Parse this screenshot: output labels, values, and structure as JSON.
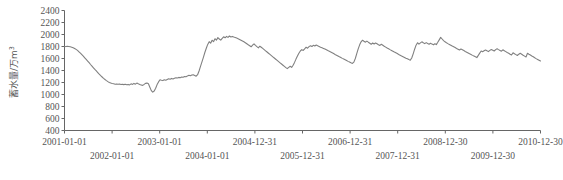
{
  "chart_data": {
    "type": "line",
    "title": "",
    "xlabel": "",
    "ylabel": "蓄水量/万m³",
    "ylabel_text": "蓄水量/万m3",
    "ylim": [
      400,
      2400
    ],
    "ytick_step": 200,
    "yticks": [
      400,
      600,
      800,
      1000,
      1200,
      1400,
      1600,
      1800,
      2000,
      2200,
      2400
    ],
    "xticks_top_row": [
      "2001-01-01",
      "2003-01-01",
      "2004-12-31",
      "2006-12-31",
      "2008-12-30",
      "2010-12-30"
    ],
    "xticks_bottom_row": [
      "2002-01-01",
      "2004-01-01",
      "2005-12-31",
      "2007-12-31",
      "2009-12-30"
    ],
    "xticks_all": [
      "2001-01-01",
      "2002-01-01",
      "2003-01-01",
      "2004-01-01",
      "2004-12-31",
      "2005-12-31",
      "2006-12-31",
      "2007-12-31",
      "2008-12-30",
      "2009-12-30",
      "2010-12-30"
    ],
    "xlim": [
      "2001-01-01",
      "2010-12-30"
    ],
    "grid": false,
    "legend": "none",
    "line_color": "#808080",
    "axis_color": "#666666",
    "series": [
      {
        "name": "蓄水量",
        "values": [
          1795,
          1800,
          1803,
          1800,
          1795,
          1788,
          1780,
          1768,
          1752,
          1735,
          1712,
          1690,
          1665,
          1640,
          1612,
          1585,
          1558,
          1530,
          1500,
          1472,
          1445,
          1418,
          1392,
          1366,
          1340,
          1315,
          1292,
          1270,
          1250,
          1232,
          1215,
          1200,
          1190,
          1182,
          1178,
          1172,
          1176,
          1170,
          1175,
          1168,
          1172,
          1165,
          1170,
          1162,
          1168,
          1160,
          1178,
          1168,
          1185,
          1172,
          1190,
          1178,
          1168,
          1160,
          1152,
          1168,
          1185,
          1190,
          1178,
          1120,
          1065,
          1040,
          1058,
          1105,
          1165,
          1210,
          1245,
          1238,
          1232,
          1245,
          1238,
          1250,
          1262,
          1255,
          1268,
          1260,
          1272,
          1280,
          1275,
          1285,
          1280,
          1292,
          1288,
          1300,
          1295,
          1310,
          1320,
          1312,
          1325,
          1330,
          1318,
          1305,
          1330,
          1392,
          1470,
          1545,
          1620,
          1700,
          1770,
          1835,
          1880,
          1855,
          1905,
          1880,
          1930,
          1905,
          1948,
          1925,
          1905,
          1935,
          1962,
          1945,
          1968,
          1952,
          1975,
          1958,
          1968,
          1958,
          1950,
          1940,
          1930,
          1918,
          1905,
          1892,
          1878,
          1862,
          1845,
          1828,
          1812,
          1795,
          1822,
          1845,
          1820,
          1798,
          1778,
          1805,
          1788,
          1768,
          1748,
          1728,
          1708,
          1688,
          1668,
          1648,
          1628,
          1608,
          1588,
          1568,
          1548,
          1528,
          1508,
          1488,
          1468,
          1448,
          1432,
          1452,
          1470,
          1452,
          1488,
          1535,
          1590,
          1640,
          1688,
          1725,
          1748,
          1735,
          1762,
          1788,
          1772,
          1798,
          1812,
          1800,
          1820,
          1808,
          1825,
          1812,
          1800,
          1788,
          1778,
          1768,
          1758,
          1745,
          1732,
          1720,
          1708,
          1695,
          1682,
          1668,
          1655,
          1642,
          1628,
          1615,
          1602,
          1590,
          1578,
          1565,
          1552,
          1540,
          1528,
          1518,
          1540,
          1600,
          1680,
          1760,
          1828,
          1878,
          1905,
          1888,
          1872,
          1890,
          1872,
          1855,
          1838,
          1858,
          1842,
          1858,
          1845,
          1830,
          1818,
          1838,
          1822,
          1805,
          1790,
          1775,
          1762,
          1748,
          1735,
          1722,
          1708,
          1695,
          1682,
          1668,
          1655,
          1642,
          1630,
          1618,
          1605,
          1595,
          1582,
          1572,
          1608,
          1678,
          1755,
          1822,
          1862,
          1840,
          1860,
          1878,
          1862,
          1848,
          1865,
          1850,
          1838,
          1855,
          1840,
          1828,
          1845,
          1832,
          1870,
          1910,
          1952,
          1925,
          1898,
          1878,
          1862,
          1848,
          1835,
          1822,
          1808,
          1795,
          1782,
          1768,
          1755,
          1742,
          1758,
          1745,
          1732,
          1718,
          1705,
          1692,
          1678,
          1665,
          1652,
          1640,
          1628,
          1615,
          1652,
          1690,
          1725,
          1712,
          1728,
          1742,
          1728,
          1715,
          1735,
          1750,
          1738,
          1725,
          1748,
          1762,
          1748,
          1735,
          1722,
          1745,
          1730,
          1715,
          1700,
          1688,
          1672,
          1658,
          1695,
          1680,
          1665,
          1650,
          1672,
          1688,
          1672,
          1655,
          1640,
          1625,
          1688,
          1672,
          1658,
          1642,
          1628,
          1612,
          1598,
          1585,
          1572,
          1558
        ]
      }
    ]
  },
  "axis": {
    "y_axis_title": "蓄水量/万m³"
  }
}
